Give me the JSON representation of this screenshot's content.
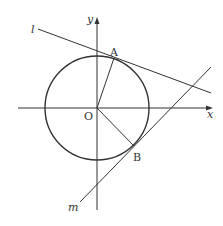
{
  "diagram": {
    "type": "coordinate-geometry",
    "axes": {
      "x_label": "x",
      "y_label": "y",
      "origin_label": "O"
    },
    "circle": {
      "center": "O"
    },
    "points": [
      {
        "label": "A"
      },
      {
        "label": "B"
      }
    ],
    "lines": [
      {
        "label": "l",
        "tangent_at": "A"
      },
      {
        "label": "m",
        "tangent_at": "B"
      }
    ],
    "segments": [
      "OA",
      "OB"
    ],
    "colors": {
      "stroke": "#333333",
      "background": "#ffffff"
    }
  }
}
